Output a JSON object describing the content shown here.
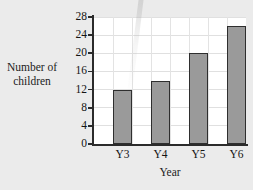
{
  "chart_data": {
    "type": "bar",
    "title": "",
    "categories": [
      "Y3",
      "Y4",
      "Y5",
      "Y6"
    ],
    "values": [
      12,
      14,
      20,
      26
    ],
    "xlabel": "Year",
    "ylabel": "Number of children",
    "ylabel_lines": [
      "Number of",
      "children"
    ],
    "ylim": [
      0,
      28
    ],
    "ytick_labels": [
      "0",
      "4",
      "8",
      "12",
      "16",
      "20",
      "24",
      "28"
    ],
    "ytick_values": [
      0,
      4,
      8,
      12,
      16,
      20,
      24,
      28
    ],
    "ytick_step": 4,
    "grid": true,
    "legend": false,
    "bar_color": "#9a9a9a",
    "bar_border_color": "#2e2e2e",
    "plot_background": "#ffffff",
    "page_background": "#ebebeb",
    "axis_color": "#2b2b2b",
    "gridline_color": "#e0e0e0"
  }
}
